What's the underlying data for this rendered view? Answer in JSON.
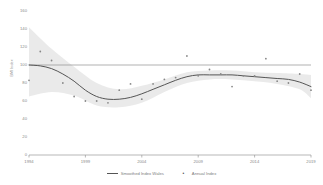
{
  "chart_data": {
    "type": "line",
    "title": "",
    "xlabel": "",
    "ylabel": "BMI Index",
    "xlim": [
      1994,
      2019
    ],
    "ylim": [
      0,
      160
    ],
    "grid": false,
    "legend_position": "bottom-center",
    "xticks": [
      1994,
      1999,
      2004,
      2009,
      2014,
      2019
    ],
    "yticks": [
      0,
      20,
      40,
      60,
      80,
      100,
      120,
      140,
      160
    ],
    "reference_line": {
      "y": 100,
      "label": ""
    },
    "series": [
      {
        "name": "Smoothed Index Wales",
        "type": "line",
        "x": [
          1994,
          1995,
          1996,
          1997,
          1998,
          1999,
          2000,
          2001,
          2002,
          2003,
          2004,
          2005,
          2006,
          2007,
          2008,
          2009,
          2010,
          2011,
          2012,
          2013,
          2014,
          2015,
          2016,
          2017,
          2018,
          2019
        ],
        "values": [
          100,
          99,
          96,
          90,
          82,
          72,
          65,
          62,
          62,
          64,
          68,
          73,
          78,
          83,
          87,
          89,
          89,
          89,
          89,
          88,
          87,
          86,
          85,
          84,
          81,
          76
        ]
      },
      {
        "name": "Annual Index",
        "type": "scatter",
        "x": [
          1994,
          1995,
          1996,
          1997,
          1998,
          1999,
          2000,
          2001,
          2002,
          2003,
          2004,
          2005,
          2006,
          2007,
          2008,
          2009,
          2010,
          2011,
          2012,
          2013,
          2014,
          2015,
          2016,
          2017,
          2018,
          2019
        ],
        "values": [
          83,
          115,
          105,
          80,
          65,
          60,
          60,
          58,
          72,
          79,
          62,
          79,
          84,
          86,
          110,
          88,
          95,
          90,
          76,
          88,
          88,
          107,
          82,
          80,
          90,
          72
        ]
      }
    ],
    "confidence_band": {
      "name": "Smoothed Index Wales CI",
      "x": [
        1994,
        1996,
        1998,
        2000,
        2002,
        2004,
        2006,
        2008,
        2010,
        2012,
        2014,
        2016,
        2018,
        2019
      ],
      "upper": [
        142,
        118,
        98,
        80,
        73,
        77,
        84,
        92,
        94,
        94,
        92,
        91,
        90,
        89
      ],
      "lower": [
        65,
        70,
        66,
        55,
        53,
        58,
        70,
        80,
        84,
        84,
        82,
        79,
        73,
        63
      ]
    }
  },
  "axis": {
    "y_title": "BMI Index",
    "y_tick_labels": [
      "160",
      "140",
      "120",
      "100",
      "80",
      "60",
      "40",
      "20",
      "0"
    ],
    "x_tick_labels": [
      "1994",
      "1999",
      "2004",
      "2009",
      "2014",
      "2019"
    ]
  },
  "legend": {
    "items": [
      {
        "label": "Smoothed Index Wales",
        "marker": "line"
      },
      {
        "label": "Annual Index",
        "marker": "dot"
      }
    ],
    "dot_glyph": "•"
  },
  "colors": {
    "line": "#555555",
    "band": "#d9d9d9",
    "point": "#888888",
    "axis": "#9a9a9a",
    "reference": "#8f8f8f",
    "text": "#8a8a8a",
    "background": "#ffffff"
  }
}
